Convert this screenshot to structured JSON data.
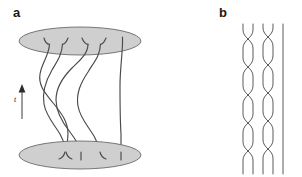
{
  "figure": {
    "width": 302,
    "height": 177,
    "background_color": "#ffffff",
    "panels": [
      {
        "id": "a",
        "label": "a",
        "label_x": 13,
        "label_y": 17,
        "description": "three-dimensional braid between two shaded elliptical discs",
        "time_axis": {
          "label": "t",
          "label_x": 14,
          "label_y": 102,
          "direction": "up",
          "arrow_x": 22,
          "arrow_top_y": 84,
          "arrow_bottom_y": 119
        },
        "discs": [
          {
            "name": "top-disc",
            "cx": 80,
            "cy": 41,
            "rx": 61,
            "ry": 14,
            "fill": "#cfcfcf",
            "stroke": "#6b6b6b"
          },
          {
            "name": "bottom-disc",
            "cx": 80,
            "cy": 155,
            "rx": 61,
            "ry": 14,
            "fill": "#cfcfcf",
            "stroke": "#6b6b6b"
          }
        ],
        "strand_count": 5,
        "stroke_color": "#4a4a4a",
        "strands": [
          {
            "name": "strand-1",
            "path": "M 49.5 44 C 49 56 42 62 40 74 C 38 86 46 94 54 104 C 62 114 68 122 68 134 C 68 143 66 148 65 152"
          },
          {
            "name": "strand-2",
            "path": "M 62.5 44 C 62 54 58 60 52 70 C 45 82 42 92 44 104 C 46 116 54 124 60 134 C 64 142 66 148 66 152"
          },
          {
            "name": "strand-3",
            "path": "M 88 44 C 88 54 80 60 72 68 C 62 78 56 88 56 100 C 56 112 62 122 70 132 C 76 140 80 146 81 152"
          },
          {
            "name": "strand-4",
            "path": "M 100.5 44 C 100 56 94 62 88 72 C 80 84 76 94 78 106 C 80 118 88 126 94 136 C 98 144 100 149 100 152"
          },
          {
            "name": "strand-5",
            "path": "M 122.5 44 C 122 58 120 70 120 86 C 120 102 120 118 121 134 C 121 144 121 149 121 152"
          }
        ],
        "top_hooks": [
          {
            "name": "top-hook-1",
            "path": "M 44 38 C 45 42 47 44 49.5 44.5"
          },
          {
            "name": "top-hook-2",
            "path": "M 68 38 C 66.5 42 64.5 44 62.5 44.5"
          },
          {
            "name": "top-hook-3",
            "path": "M 82 38 C 83.5 42 86 44 88 44.5"
          },
          {
            "name": "top-hook-4",
            "path": "M 106 38 C 104.5 42 102.5 44 100.5 44.5"
          },
          {
            "name": "top-hook-5",
            "path": "M 122.5 37 L 122.5 44.5"
          }
        ],
        "bottom_hooks": [
          {
            "name": "bottom-hook-1",
            "path": "M 65 152 C 64 156 62 158 59 159"
          },
          {
            "name": "bottom-hook-2",
            "path": "M 66 152 C 67 156 69 158 72 159"
          },
          {
            "name": "bottom-hook-3",
            "path": "M 81 152 C 81 156 81 158 81 160"
          },
          {
            "name": "bottom-hook-4",
            "path": "M 100 152 C 101 156 103 158 106 159"
          },
          {
            "name": "bottom-hook-5",
            "path": "M 121 152 L 121 160"
          }
        ]
      },
      {
        "id": "b",
        "label": "b",
        "label_x": 219,
        "label_y": 17,
        "description": "two-dimensional braid word diagram with four braided strands and one straight strand",
        "stroke_color": "#5a5a5a",
        "strand_count": 5,
        "lane_x": [
          243,
          253,
          263,
          273,
          283
        ],
        "top_y": 24,
        "bottom_y": 174,
        "crossings": [
          {
            "name": "crossing-1",
            "lanes": [
              1,
              2
            ],
            "y": 38
          },
          {
            "name": "crossing-2",
            "lanes": [
              3,
              4
            ],
            "y": 30
          },
          {
            "name": "crossing-3",
            "lanes": [
              2,
              3
            ],
            "y": 56
          },
          {
            "name": "crossing-4",
            "lanes": [
              1,
              2
            ],
            "y": 74
          },
          {
            "name": "crossing-5",
            "lanes": [
              3,
              4
            ],
            "y": 68
          },
          {
            "name": "crossing-6",
            "lanes": [
              2,
              3
            ],
            "y": 92
          },
          {
            "name": "crossing-7",
            "lanes": [
              1,
              2
            ],
            "y": 110
          },
          {
            "name": "crossing-8",
            "lanes": [
              3,
              4
            ],
            "y": 104
          },
          {
            "name": "crossing-9",
            "lanes": [
              2,
              3
            ],
            "y": 128
          },
          {
            "name": "crossing-10",
            "lanes": [
              1,
              2
            ],
            "y": 146
          },
          {
            "name": "crossing-11",
            "lanes": [
              3,
              4
            ],
            "y": 140
          },
          {
            "name": "crossing-12",
            "lanes": [
              2,
              3
            ],
            "y": 164
          }
        ],
        "strands": [
          {
            "name": "strand-b-1",
            "path": "M 243 24 L 243 30 C 243 38 253 40 253 48 L 253 58 C 253 66 243 68 243 76 L 243 86 C 243 94 253 96 253 104 L 253 114 C 253 122 243 124 243 132 L 243 142 C 243 150 253 152 253 160 L 253 174"
          },
          {
            "name": "strand-b-2",
            "path": "M 253 24 L 253 30 C 253 38 243 40 243 48 L 243 58 C 243 66 253 68 253 76 L 253 86 C 253 94 243 96 243 104 L 243 114 C 243 122 253 124 253 132 L 253 142 C 253 150 243 152 243 160 L 243 174"
          },
          {
            "name": "strand-b-3",
            "path": "M 263 24 L 263 28 C 263 36 273 38 273 46 L 273 56 C 273 64 263 66 263 74 L 263 84 C 263 92 273 94 273 102 L 273 112 C 273 120 263 122 263 130 L 263 140 C 263 148 273 150 273 158 L 273 174"
          },
          {
            "name": "strand-b-4",
            "path": "M 273 24 L 273 28 C 273 36 263 38 263 46 L 263 56 C 263 64 273 66 273 74 L 273 84 C 273 92 263 94 263 102 L 263 112 C 263 120 273 122 273 130 L 273 140 C 273 148 263 150 263 158 L 263 174"
          },
          {
            "name": "strand-b-5",
            "path": "M 283 24 L 283 174"
          }
        ]
      }
    ]
  }
}
